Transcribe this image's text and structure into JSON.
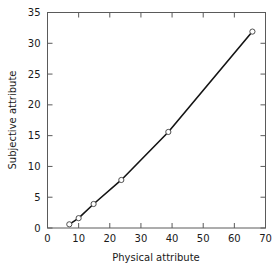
{
  "chart_data": {
    "type": "line",
    "title": "",
    "xlabel": "Physical attribute",
    "ylabel": "Subjective attribute",
    "xlim": [
      0,
      70
    ],
    "ylim": [
      0,
      35
    ],
    "xticks": [
      0,
      10,
      20,
      30,
      40,
      50,
      60,
      70
    ],
    "yticks": [
      0,
      5,
      10,
      15,
      20,
      25,
      30,
      35
    ],
    "xtick_labels": [
      "0",
      "10",
      "20",
      "30",
      "40",
      "50",
      "60",
      "70"
    ],
    "ytick_labels": [
      "0",
      "5",
      "10",
      "15",
      "20",
      "25",
      "30",
      "35"
    ],
    "grid": false,
    "legend": null,
    "frame": "box-all-sides-inward-ticks",
    "line_color": "#141414",
    "marker_style": "open-circle",
    "marker_face_color": "#ffffff",
    "marker_edge_color": "#3c3c3c",
    "background_color": "#ffffff",
    "series": [
      {
        "name": "Subjective vs physical attribute",
        "x": [
          7.0,
          10.0,
          14.8,
          23.7,
          38.8,
          65.8
        ],
        "y": [
          0.6,
          1.6,
          3.9,
          7.8,
          15.6,
          31.9
        ]
      }
    ]
  }
}
